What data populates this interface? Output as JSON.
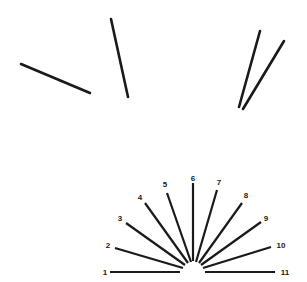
{
  "figure": {
    "stroke_color": "#1a1a1a",
    "background": "#ffffff",
    "test_lines": [
      {
        "id": "A",
        "x1": 21,
        "y1": 64,
        "x2": 90,
        "y2": 93
      },
      {
        "id": "B",
        "x1": 111,
        "y1": 19,
        "x2": 128,
        "y2": 97
      },
      {
        "id": "C",
        "x1": 260,
        "y1": 31,
        "x2": 239,
        "y2": 107
      },
      {
        "id": "D",
        "x1": 284,
        "y1": 41,
        "x2": 243,
        "y2": 109
      }
    ],
    "fan": {
      "center": [
        193,
        272
      ],
      "lines": [
        {
          "label": "1",
          "x1": 110,
          "y1": 272,
          "x2": 180,
          "y2": 272,
          "lx": 105,
          "ly": 275
        },
        {
          "label": "2",
          "x1": 115,
          "y1": 248,
          "x2": 183,
          "y2": 268,
          "lx": 108,
          "ly": 248
        },
        {
          "label": "3",
          "x1": 126,
          "y1": 223,
          "x2": 185,
          "y2": 265,
          "lx": 120,
          "ly": 221
        },
        {
          "label": "4",
          "x1": 145,
          "y1": 203,
          "x2": 188,
          "y2": 263,
          "lx": 140,
          "ly": 200
        },
        {
          "label": "5",
          "x1": 167,
          "y1": 193,
          "x2": 191,
          "y2": 262,
          "lx": 165,
          "ly": 187
        },
        {
          "label": "6",
          "x1": 193,
          "y1": 183,
          "x2": 193,
          "y2": 261,
          "lx": 193,
          "ly": 181
        },
        {
          "label": "7",
          "x1": 217,
          "y1": 190,
          "x2": 196,
          "y2": 262,
          "lx": 219,
          "ly": 185
        },
        {
          "label": "8",
          "x1": 242,
          "y1": 203,
          "x2": 199,
          "y2": 263,
          "lx": 246,
          "ly": 198
        },
        {
          "label": "9",
          "x1": 261,
          "y1": 222,
          "x2": 201,
          "y2": 265,
          "lx": 266,
          "ly": 221
        },
        {
          "label": "10",
          "x1": 271,
          "y1": 247,
          "x2": 203,
          "y2": 268,
          "lx": 281,
          "ly": 248
        },
        {
          "label": "11",
          "x1": 205,
          "y1": 272,
          "x2": 275,
          "y2": 272,
          "lx": 285,
          "ly": 275
        }
      ]
    }
  }
}
